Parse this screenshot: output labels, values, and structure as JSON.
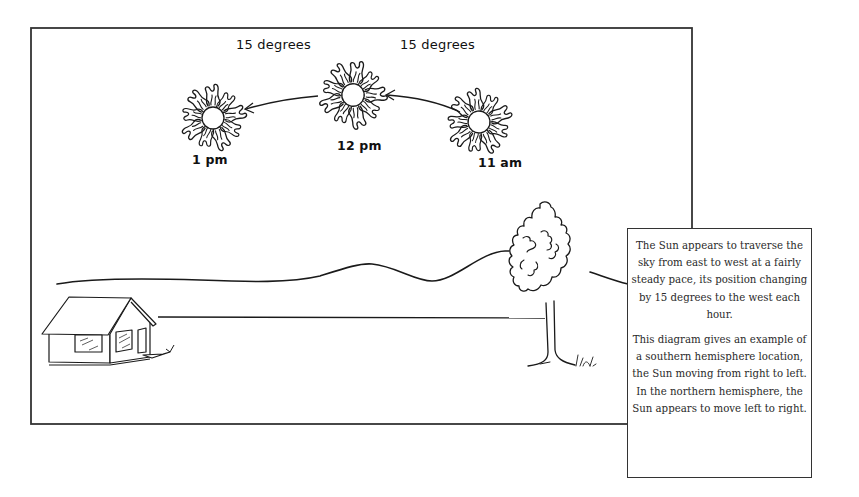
{
  "diagram": {
    "suns": [
      {
        "id": "sun-1pm",
        "time_label": "1 pm",
        "cx": 213,
        "cy": 118
      },
      {
        "id": "sun-12pm",
        "time_label": "12 pm",
        "cx": 353,
        "cy": 95
      },
      {
        "id": "sun-11am",
        "time_label": "11 am",
        "cx": 479,
        "cy": 122
      }
    ],
    "arrows": [
      {
        "from": "12 pm",
        "to": "1 pm",
        "label": "15 degrees"
      },
      {
        "from": "11 am",
        "to": "12 pm",
        "label": "15 degrees"
      }
    ],
    "landscape": {
      "elements": [
        "house",
        "hill line",
        "horizon line",
        "tree",
        "grass tufts"
      ],
      "signature": "Vick"
    },
    "caption": {
      "paragraph1": "The Sun appears to traverse the sky from east to west at a fairly steady pace, its position changing by 15 degrees to the west each hour.",
      "paragraph2": "This diagram gives an example of a southern hemisphere location, the Sun moving from right to left. In the northern hemisphere, the Sun appears to move left to right."
    },
    "colors": {
      "line": "#1a1a1a",
      "background": "#ffffff",
      "frame": "#333333"
    }
  }
}
